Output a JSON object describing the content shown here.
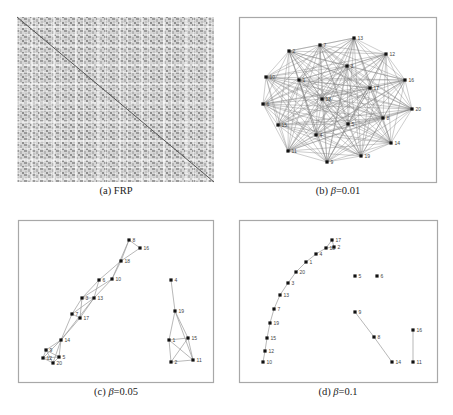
{
  "figure": {
    "panels": [
      {
        "id": "a",
        "caption_prefix": "(a) ",
        "caption_main": "FRP",
        "caption_suffix": ""
      },
      {
        "id": "b",
        "caption_prefix": "(b) ",
        "caption_main": "β",
        "caption_suffix": "=0.01"
      },
      {
        "id": "c",
        "caption_prefix": "(c) ",
        "caption_main": "β",
        "caption_suffix": "=0.05"
      },
      {
        "id": "d",
        "caption_prefix": "(d) ",
        "caption_main": "β",
        "caption_suffix": "=0.1"
      }
    ]
  },
  "chart_data": [
    {
      "type": "heatmap",
      "title": "(a) FRP",
      "description": "Fuzzy relation / recurrence matrix, grayscale, with dark main diagonal",
      "box": [
        17,
        17,
        214,
        182
      ]
    },
    {
      "type": "network",
      "title": "(b) β=0.01",
      "box": [
        239,
        17,
        436,
        182
      ],
      "fully_connected": true,
      "nodes": [
        {
          "id": "13",
          "x": 354,
          "y": 38
        },
        {
          "id": "7",
          "x": 320,
          "y": 45
        },
        {
          "id": "2",
          "x": 289,
          "y": 51
        },
        {
          "id": "12",
          "x": 386,
          "y": 54
        },
        {
          "id": "3",
          "x": 347,
          "y": 66
        },
        {
          "id": "10",
          "x": 266,
          "y": 77
        },
        {
          "id": "1",
          "x": 299,
          "y": 80
        },
        {
          "id": "16",
          "x": 405,
          "y": 80
        },
        {
          "id": "17",
          "x": 370,
          "y": 88
        },
        {
          "id": "18",
          "x": 322,
          "y": 99
        },
        {
          "id": "6",
          "x": 263,
          "y": 104
        },
        {
          "id": "20",
          "x": 412,
          "y": 109
        },
        {
          "id": "8",
          "x": 383,
          "y": 118
        },
        {
          "id": "5",
          "x": 348,
          "y": 124
        },
        {
          "id": "15",
          "x": 278,
          "y": 125
        },
        {
          "id": "4",
          "x": 316,
          "y": 135
        },
        {
          "id": "14",
          "x": 391,
          "y": 143
        },
        {
          "id": "11",
          "x": 288,
          "y": 151
        },
        {
          "id": "19",
          "x": 361,
          "y": 156
        },
        {
          "id": "9",
          "x": 327,
          "y": 162
        }
      ]
    },
    {
      "type": "network",
      "title": "(c) β=0.05",
      "box": [
        18,
        220,
        213,
        382
      ],
      "nodes": [
        {
          "id": "8",
          "x": 129,
          "y": 240
        },
        {
          "id": "16",
          "x": 140,
          "y": 248
        },
        {
          "id": "18",
          "x": 121,
          "y": 261
        },
        {
          "id": "6",
          "x": 99,
          "y": 280
        },
        {
          "id": "10",
          "x": 112,
          "y": 279
        },
        {
          "id": "3",
          "x": 82,
          "y": 298
        },
        {
          "id": "13",
          "x": 94,
          "y": 298
        },
        {
          "id": "7",
          "x": 72,
          "y": 314
        },
        {
          "id": "17",
          "x": 80,
          "y": 318
        },
        {
          "id": "14",
          "x": 61,
          "y": 340
        },
        {
          "id": "9",
          "x": 46,
          "y": 350
        },
        {
          "id": "5",
          "x": 59,
          "y": 357
        },
        {
          "id": "12",
          "x": 43,
          "y": 358
        },
        {
          "id": "20",
          "x": 53,
          "y": 363
        },
        {
          "id": "4",
          "x": 171,
          "y": 280
        },
        {
          "id": "19",
          "x": 175,
          "y": 311
        },
        {
          "id": "1",
          "x": 169,
          "y": 340
        },
        {
          "id": "15",
          "x": 188,
          "y": 338
        },
        {
          "id": "2",
          "x": 171,
          "y": 362
        },
        {
          "id": "11",
          "x": 193,
          "y": 360
        }
      ],
      "edges": [
        [
          "8",
          "16"
        ],
        [
          "8",
          "18"
        ],
        [
          "16",
          "18"
        ],
        [
          "18",
          "6"
        ],
        [
          "18",
          "10"
        ],
        [
          "8",
          "10"
        ],
        [
          "6",
          "3"
        ],
        [
          "6",
          "13"
        ],
        [
          "10",
          "13"
        ],
        [
          "10",
          "3"
        ],
        [
          "3",
          "13"
        ],
        [
          "3",
          "7"
        ],
        [
          "3",
          "17"
        ],
        [
          "13",
          "7"
        ],
        [
          "13",
          "17"
        ],
        [
          "7",
          "17"
        ],
        [
          "7",
          "14"
        ],
        [
          "17",
          "14"
        ],
        [
          "13",
          "14"
        ],
        [
          "14",
          "9"
        ],
        [
          "14",
          "5"
        ],
        [
          "14",
          "12"
        ],
        [
          "14",
          "20"
        ],
        [
          "9",
          "5"
        ],
        [
          "9",
          "12"
        ],
        [
          "9",
          "20"
        ],
        [
          "12",
          "20"
        ],
        [
          "5",
          "20"
        ],
        [
          "12",
          "5"
        ],
        [
          "4",
          "19"
        ],
        [
          "19",
          "1"
        ],
        [
          "19",
          "15"
        ],
        [
          "19",
          "11"
        ],
        [
          "1",
          "15"
        ],
        [
          "1",
          "2"
        ],
        [
          "1",
          "11"
        ],
        [
          "15",
          "2"
        ],
        [
          "15",
          "11"
        ],
        [
          "2",
          "11"
        ]
      ]
    },
    {
      "type": "network",
      "title": "(d) β=0.1",
      "box": [
        239,
        220,
        437,
        382
      ],
      "nodes": [
        {
          "id": "17",
          "x": 332,
          "y": 240
        },
        {
          "id": "18",
          "x": 326,
          "y": 248
        },
        {
          "id": "2",
          "x": 334,
          "y": 247
        },
        {
          "id": "4",
          "x": 316,
          "y": 254
        },
        {
          "id": "1",
          "x": 306,
          "y": 262
        },
        {
          "id": "20",
          "x": 296,
          "y": 272
        },
        {
          "id": "3",
          "x": 288,
          "y": 283
        },
        {
          "id": "13",
          "x": 280,
          "y": 295
        },
        {
          "id": "7",
          "x": 274,
          "y": 309
        },
        {
          "id": "19",
          "x": 270,
          "y": 323
        },
        {
          "id": "15",
          "x": 267,
          "y": 338
        },
        {
          "id": "12",
          "x": 265,
          "y": 351
        },
        {
          "id": "10",
          "x": 263,
          "y": 362
        },
        {
          "id": "5",
          "x": 355,
          "y": 276
        },
        {
          "id": "6",
          "x": 377,
          "y": 276
        },
        {
          "id": "9",
          "x": 355,
          "y": 312
        },
        {
          "id": "8",
          "x": 374,
          "y": 337
        },
        {
          "id": "14",
          "x": 392,
          "y": 362
        },
        {
          "id": "16",
          "x": 413,
          "y": 330
        },
        {
          "id": "11",
          "x": 413,
          "y": 362
        }
      ],
      "edges": [
        [
          "17",
          "18"
        ],
        [
          "17",
          "2"
        ],
        [
          "18",
          "2"
        ],
        [
          "18",
          "4"
        ],
        [
          "4",
          "1"
        ],
        [
          "1",
          "20"
        ],
        [
          "20",
          "3"
        ],
        [
          "3",
          "13"
        ],
        [
          "13",
          "7"
        ],
        [
          "7",
          "19"
        ],
        [
          "19",
          "15"
        ],
        [
          "15",
          "12"
        ],
        [
          "12",
          "10"
        ],
        [
          "9",
          "8"
        ],
        [
          "8",
          "14"
        ],
        [
          "16",
          "11"
        ]
      ]
    }
  ]
}
